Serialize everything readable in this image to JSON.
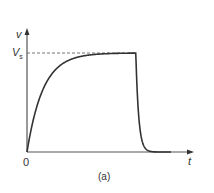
{
  "chart_data": {
    "type": "line",
    "title": "",
    "caption": "(a)",
    "xlabel": "t",
    "ylabel": "v",
    "origin_label": "0",
    "reference_line": {
      "label": "V_s",
      "label_main": "V",
      "label_sub": "s",
      "value": 1.0,
      "style": "dashed"
    },
    "x_ticks": [],
    "y_ticks": [],
    "grid": false,
    "legend": null,
    "xlim": [
      0,
      1.0
    ],
    "ylim": [
      0,
      1.2
    ],
    "series": [
      {
        "name": "v(t)",
        "description": "Exponential rise toward V_s (charging), then rapid exponential fall to 0 (discharging)",
        "x": [
          0.0,
          0.05,
          0.1,
          0.15,
          0.2,
          0.3,
          0.4,
          0.5,
          0.6,
          0.68,
          0.69,
          0.7,
          0.72,
          0.74,
          0.76,
          0.78,
          0.8,
          0.85,
          0.9
        ],
        "y": [
          0.0,
          0.39,
          0.63,
          0.78,
          0.86,
          0.95,
          0.98,
          0.99,
          1.0,
          1.0,
          0.6,
          0.37,
          0.14,
          0.05,
          0.02,
          0.01,
          0.0,
          0.0,
          0.0
        ]
      }
    ],
    "colors": {
      "axis": "#555555",
      "curve": "#333333",
      "dashed": "#777777",
      "text": "#333333"
    }
  }
}
